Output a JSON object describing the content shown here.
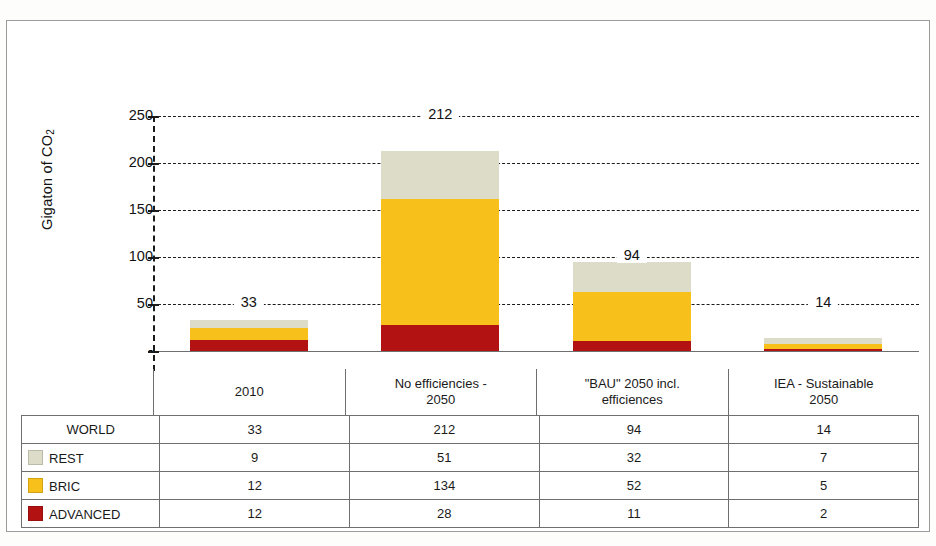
{
  "chart_data": {
    "type": "bar",
    "subtype": "stacked-bar",
    "title": "",
    "xlabel": "",
    "ylabel": "Gigaton of CO",
    "ylabel_sub": "2",
    "ylim": [
      0,
      250
    ],
    "yticks": [
      "-",
      "50",
      "100",
      "150",
      "200",
      "250"
    ],
    "ytick_values": [
      0,
      50,
      100,
      150,
      200,
      250
    ],
    "grid": true,
    "grid_style": "dashed",
    "legend_position": "table",
    "categories": [
      "2010",
      "No efficiencies - 2050",
      "\"BAU\" 2050 incl. efficiences",
      "IEA - Sustainable 2050"
    ],
    "series": [
      {
        "name": "ADVANCED",
        "color": "#B31212",
        "values": [
          12,
          28,
          11,
          2
        ]
      },
      {
        "name": "BRIC",
        "color": "#F8C01B",
        "values": [
          12,
          134,
          52,
          5
        ]
      },
      {
        "name": "REST",
        "color": "#DCDCC8",
        "values": [
          9,
          51,
          32,
          7
        ]
      }
    ],
    "totals_label": "WORLD",
    "totals": [
      33,
      212,
      94,
      14
    ],
    "bar_value_labels": [
      "33",
      "212",
      "94",
      "14"
    ],
    "bar_value_label_gridline": [
      50,
      250,
      100,
      50
    ]
  },
  "table": {
    "header": [
      "",
      "2010",
      "No efficiencies - 2050",
      "\"BAU\" 2050 incl. efficiences",
      "IEA - Sustainable 2050"
    ],
    "header_lines": [
      [
        "",
        ""
      ],
      [
        "2010",
        ""
      ],
      [
        "No efficiencies -",
        "2050"
      ],
      [
        "\"BAU\" 2050 incl.",
        "efficiences"
      ],
      [
        "IEA - Sustainable",
        "2050"
      ]
    ],
    "rows": [
      {
        "label": "WORLD",
        "swatch": "",
        "values": [
          "33",
          "212",
          "94",
          "14"
        ]
      },
      {
        "label": "REST",
        "swatch": "#DCDCC8",
        "values": [
          "9",
          "51",
          "32",
          "7"
        ]
      },
      {
        "label": "BRIC",
        "swatch": "#F8C01B",
        "values": [
          "12",
          "134",
          "52",
          "5"
        ]
      },
      {
        "label": "ADVANCED",
        "swatch": "#B31212",
        "values": [
          "12",
          "28",
          "11",
          "2"
        ]
      }
    ]
  },
  "colors": {
    "advanced": "#B31212",
    "bric": "#F8C01B",
    "rest": "#DCDCC8",
    "axis": "#1b1b1b",
    "frame": "#9b9b9b",
    "table_line": "#6f6f6f"
  }
}
